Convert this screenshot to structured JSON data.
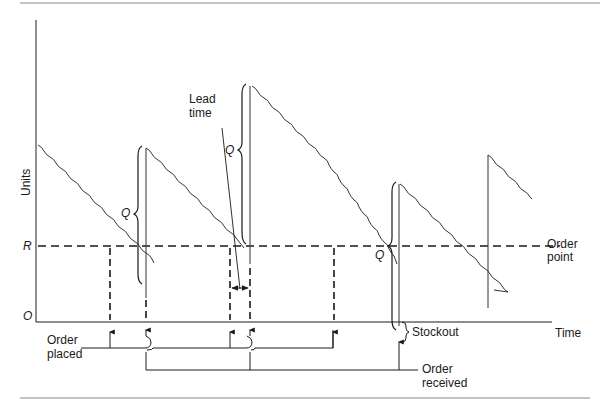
{
  "diagram": {
    "type": "inventory-reorder-point-model",
    "axes": {
      "y_label": "Units",
      "x_label": "Time",
      "origin_label": "O",
      "reorder_level_label": "R"
    },
    "labels": {
      "order_quantity": "Q",
      "lead_time_line1": "Lead",
      "lead_time_line2": "time",
      "order_point_line1": "Order",
      "order_point_line2": "point",
      "order_placed_line1": "Order",
      "order_placed_line2": "placed",
      "order_received_line1": "Order",
      "order_received_line2": "received",
      "stockout": "Stockout"
    },
    "colors": {
      "ink": "#1a1a1a",
      "rule": "#888888",
      "background": "#ffffff"
    },
    "cycles": [
      {
        "order_placed_x": 110,
        "order_received_x": 146
      },
      {
        "order_placed_x": 230,
        "order_received_x": 250
      },
      {
        "order_placed_x": 333,
        "order_received_x": 399
      },
      {
        "order_placed_x": null,
        "order_received_x": 488
      }
    ]
  }
}
